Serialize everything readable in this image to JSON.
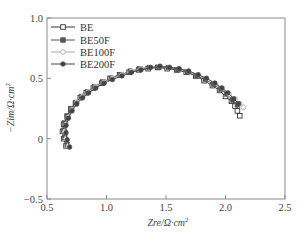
{
  "chart_data": {
    "type": "scatter",
    "title": "",
    "xlabel": "Zre/Ω·cm²",
    "ylabel": "−Zim/Ω·cm²",
    "xlim": [
      0.5,
      2.5
    ],
    "ylim": [
      -0.5,
      1.0
    ],
    "xticks": [
      0.5,
      1.0,
      1.5,
      2.0,
      2.5
    ],
    "xtick_labels": [
      "0.5",
      "1.0",
      "1.5",
      "2.0",
      "2.5"
    ],
    "yticks": [
      -0.5,
      0,
      0.5,
      1.0
    ],
    "ytick_labels": [
      "−0.5",
      "0",
      "0.5",
      "1.0"
    ],
    "grid": false,
    "legend_position": "upper left",
    "series": [
      {
        "name": "BE",
        "marker": "hollow-square",
        "color": "#333333",
        "x": [
          0.66,
          0.64,
          0.63,
          0.64,
          0.67,
          0.7,
          0.74,
          0.78,
          0.83,
          0.89,
          0.96,
          1.03,
          1.11,
          1.19,
          1.27,
          1.35,
          1.43,
          1.51,
          1.59,
          1.67,
          1.75,
          1.82,
          1.89,
          1.95,
          2.0,
          2.05,
          2.08,
          2.1,
          2.12
        ],
        "y": [
          -0.06,
          0.0,
          0.06,
          0.12,
          0.18,
          0.24,
          0.29,
          0.34,
          0.38,
          0.42,
          0.46,
          0.5,
          0.53,
          0.55,
          0.57,
          0.58,
          0.59,
          0.58,
          0.57,
          0.55,
          0.52,
          0.48,
          0.44,
          0.4,
          0.35,
          0.31,
          0.27,
          0.23,
          0.19
        ]
      },
      {
        "name": "BE50F",
        "marker": "filled-square",
        "color": "#555555",
        "x": [
          0.67,
          0.65,
          0.64,
          0.65,
          0.67,
          0.7,
          0.74,
          0.79,
          0.84,
          0.9,
          0.97,
          1.04,
          1.12,
          1.2,
          1.28,
          1.36,
          1.44,
          1.52,
          1.6,
          1.68,
          1.76,
          1.83,
          1.9,
          1.96,
          2.01,
          2.06,
          2.1
        ],
        "y": [
          -0.05,
          0.01,
          0.07,
          0.13,
          0.19,
          0.25,
          0.3,
          0.35,
          0.39,
          0.43,
          0.47,
          0.5,
          0.53,
          0.56,
          0.58,
          0.59,
          0.59,
          0.59,
          0.57,
          0.55,
          0.52,
          0.49,
          0.45,
          0.41,
          0.37,
          0.32,
          0.28
        ]
      },
      {
        "name": "BE100F",
        "marker": "hollow-circle",
        "color": "#aaaaaa",
        "x": [
          0.68,
          0.66,
          0.65,
          0.66,
          0.68,
          0.71,
          0.75,
          0.8,
          0.85,
          0.91,
          0.98,
          1.05,
          1.13,
          1.21,
          1.29,
          1.37,
          1.45,
          1.53,
          1.61,
          1.69,
          1.77,
          1.84,
          1.91,
          1.97,
          2.03,
          2.08,
          2.12,
          2.15
        ],
        "y": [
          -0.06,
          0.0,
          0.06,
          0.12,
          0.18,
          0.24,
          0.3,
          0.35,
          0.39,
          0.43,
          0.47,
          0.5,
          0.53,
          0.56,
          0.58,
          0.59,
          0.6,
          0.59,
          0.58,
          0.56,
          0.53,
          0.5,
          0.46,
          0.42,
          0.37,
          0.33,
          0.29,
          0.26
        ]
      },
      {
        "name": "BE200F",
        "marker": "filled-circle",
        "color": "#444444",
        "x": [
          0.69,
          0.67,
          0.66,
          0.66,
          0.68,
          0.71,
          0.75,
          0.8,
          0.85,
          0.91,
          0.98,
          1.05,
          1.13,
          1.21,
          1.29,
          1.37,
          1.45,
          1.53,
          1.61,
          1.69,
          1.77,
          1.84,
          1.91,
          1.97,
          2.02,
          2.07,
          2.11
        ],
        "y": [
          -0.07,
          -0.01,
          0.05,
          0.11,
          0.17,
          0.23,
          0.29,
          0.34,
          0.38,
          0.42,
          0.46,
          0.49,
          0.52,
          0.55,
          0.57,
          0.59,
          0.6,
          0.59,
          0.58,
          0.56,
          0.53,
          0.5,
          0.46,
          0.42,
          0.38,
          0.33,
          0.29
        ]
      }
    ]
  },
  "legend": {
    "items": [
      "BE",
      "BE50F",
      "BE100F",
      "BE200F"
    ]
  },
  "axes": {
    "x_label_main": "Zre/Ω·cm",
    "x_label_sup": "2",
    "y_label_main": "−Zim/Ω·cm",
    "y_label_sup": "2"
  }
}
